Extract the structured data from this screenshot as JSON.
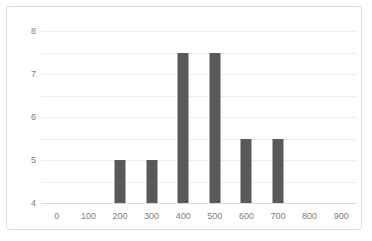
{
  "chart_data": {
    "type": "bar",
    "title": "",
    "subtitle": "",
    "xlabel": "",
    "ylabel": "",
    "categories": [
      "0",
      "100",
      "200",
      "300",
      "400",
      "500",
      "600",
      "700",
      "800",
      "900"
    ],
    "values": [
      0,
      0,
      2,
      2,
      7,
      7,
      3,
      3,
      0,
      0
    ],
    "ylim": [
      0,
      8
    ],
    "y_ticks": [
      "0",
      "1",
      "2",
      "3",
      "4",
      "5",
      "6",
      "7",
      "8"
    ],
    "grid": true,
    "legend": false,
    "legend_position": "none",
    "annotations": []
  },
  "style": {
    "bar_color": "#595959",
    "gridline_color": "#eceded",
    "axis_color": "#d9d9d9",
    "tick_label_color": "#808080",
    "frame_border_color": "#dcdcdc",
    "background_color": "#ffffff"
  }
}
